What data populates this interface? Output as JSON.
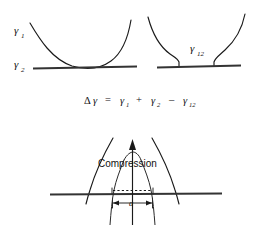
{
  "figure": {
    "background_color": "#ffffff",
    "ink_color": "#1a1a1a",
    "panels": {
      "left": {
        "name": "non-contact-panel",
        "curve_label": "γ",
        "curve_label_sub": "1",
        "baseline_label": "γ",
        "baseline_label_sub": "2",
        "description": "parabolic curve tangent to horizontal baseline"
      },
      "right": {
        "name": "contact-panel",
        "interface_label": "γ",
        "interface_label_sub": "12",
        "description": "two curves meeting baseline with flat contact interface"
      }
    },
    "equation": {
      "name": "work-of-adhesion-equation",
      "delta": "Δ",
      "gamma": "γ",
      "equals": "=",
      "term1": "γ",
      "term1_sub": "1",
      "plus": "+",
      "term2": "γ",
      "term2_sub": "2",
      "minus": "–",
      "term3": "γ",
      "term3_sub": "12",
      "full_text": "Δγ = γ₁ + β₂ – γ₁₂"
    },
    "bottom": {
      "name": "compression-panel",
      "arrow_label": "Compression",
      "dimension_label": "a",
      "description": "two spheres compressed together forming contact radius a"
    }
  }
}
